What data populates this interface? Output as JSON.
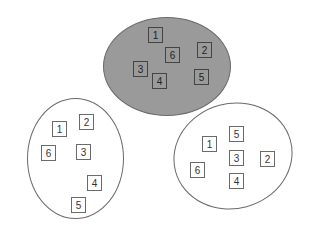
{
  "diagram": {
    "groups": [
      {
        "name": "top-cluster",
        "fill": "#9a9a9a",
        "x": 103,
        "y": 17,
        "w": 128,
        "h": 99,
        "rotate": 0,
        "boxes": [
          {
            "label": "1",
            "x": 148,
            "y": 27
          },
          {
            "label": "6",
            "x": 165,
            "y": 47
          },
          {
            "label": "2",
            "x": 197,
            "y": 42
          },
          {
            "label": "3",
            "x": 133,
            "y": 61
          },
          {
            "label": "4",
            "x": 152,
            "y": 73
          },
          {
            "label": "5",
            "x": 194,
            "y": 69
          }
        ]
      },
      {
        "name": "left-cluster",
        "fill": "#ffffff",
        "x": 27,
        "y": 98,
        "w": 97,
        "h": 121,
        "rotate": 0,
        "boxes": [
          {
            "label": "1",
            "x": 52,
            "y": 121
          },
          {
            "label": "2",
            "x": 79,
            "y": 114
          },
          {
            "label": "6",
            "x": 41,
            "y": 145
          },
          {
            "label": "3",
            "x": 76,
            "y": 144
          },
          {
            "label": "4",
            "x": 87,
            "y": 175
          },
          {
            "label": "5",
            "x": 71,
            "y": 197
          }
        ]
      },
      {
        "name": "right-cluster",
        "fill": "#ffffff",
        "x": 173,
        "y": 103,
        "w": 120,
        "h": 106,
        "rotate": -15,
        "boxes": [
          {
            "label": "5",
            "x": 229,
            "y": 126
          },
          {
            "label": "1",
            "x": 202,
            "y": 136
          },
          {
            "label": "3",
            "x": 229,
            "y": 150
          },
          {
            "label": "2",
            "x": 260,
            "y": 151
          },
          {
            "label": "6",
            "x": 190,
            "y": 162
          },
          {
            "label": "4",
            "x": 229,
            "y": 173
          }
        ]
      }
    ]
  }
}
